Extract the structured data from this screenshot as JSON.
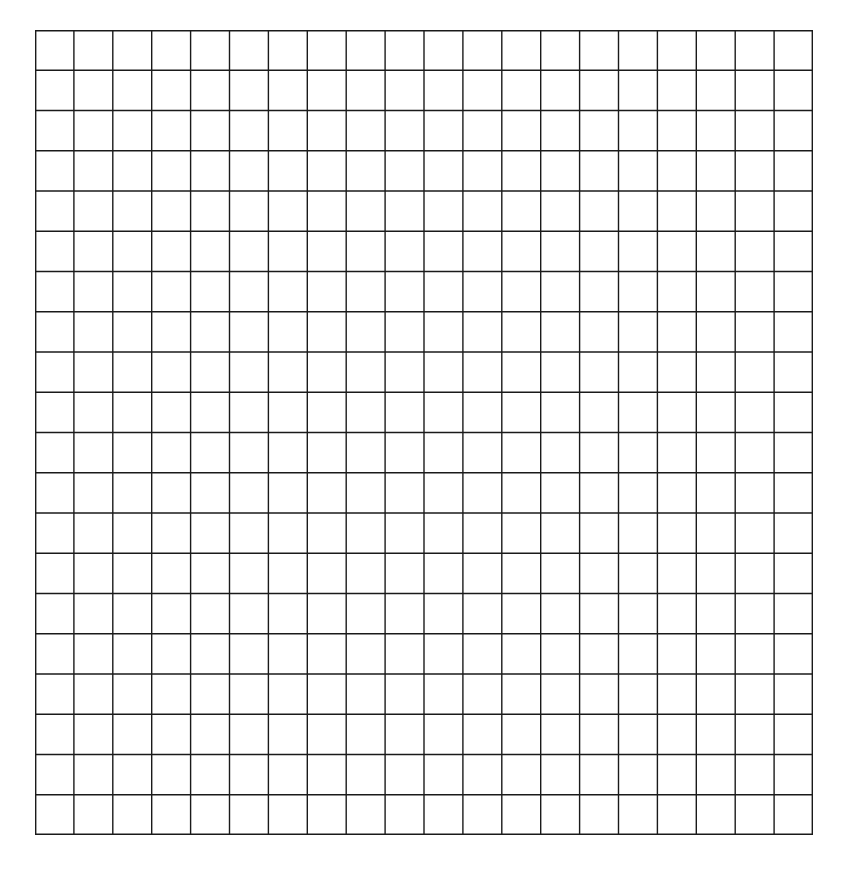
{
  "figure": {
    "type": "blank-grid",
    "rows": 20,
    "columns": 20,
    "line_color": "#1a1a1a",
    "background_color": "#ffffff"
  }
}
